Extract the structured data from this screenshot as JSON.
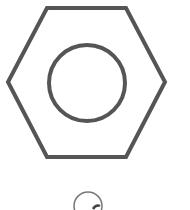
{
  "diagram": {
    "stroke_color": "#555555",
    "background": "#ffffff",
    "hexagon_points": "47,8 126,8 165,82 126,157 47,157 8,82",
    "inner_circle": {
      "cx": 87,
      "cy": 83,
      "r": 38
    },
    "partial_label_circle": {
      "cx": 88,
      "cy": 206,
      "r": 14
    }
  }
}
